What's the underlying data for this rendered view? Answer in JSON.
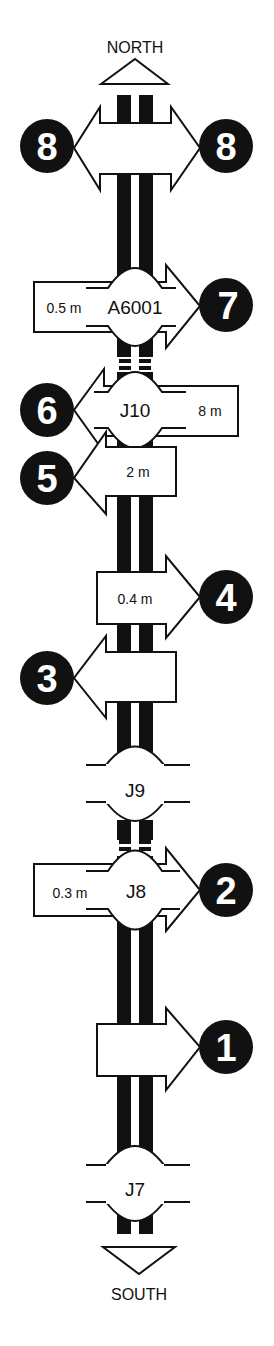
{
  "directions": {
    "north": "NORTH",
    "south": "SOUTH"
  },
  "colors": {
    "road": "#111111",
    "background": "#ffffff",
    "marker": "#111111",
    "marker_text": "#ffffff"
  },
  "junctions": [
    {
      "id": "A6001",
      "label": "A6001"
    },
    {
      "id": "J10",
      "label": "J10"
    },
    {
      "id": "J9",
      "label": "J9"
    },
    {
      "id": "J8",
      "label": "J8"
    },
    {
      "id": "J7",
      "label": "J7"
    }
  ],
  "markers": [
    {
      "number": "8",
      "side": "left",
      "note": "double arrow west/east"
    },
    {
      "number": "8",
      "side": "right"
    },
    {
      "number": "7",
      "side": "right",
      "distance": "0.5 m",
      "junction": "A6001"
    },
    {
      "number": "6",
      "side": "left",
      "distance": "8 m",
      "junction": "J10"
    },
    {
      "number": "5",
      "side": "left",
      "distance": "2 m"
    },
    {
      "number": "4",
      "side": "right",
      "distance": "0.4 m"
    },
    {
      "number": "3",
      "side": "left",
      "distance": ""
    },
    {
      "number": "2",
      "side": "right",
      "distance": "0.3 m",
      "junction": "J8"
    },
    {
      "number": "1",
      "side": "right",
      "distance": ""
    }
  ]
}
